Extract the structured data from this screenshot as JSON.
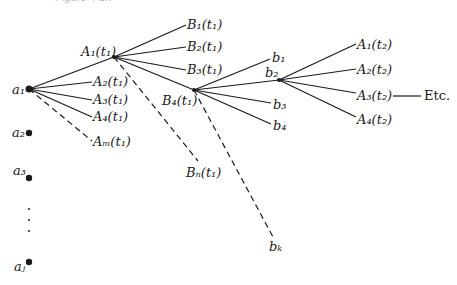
{
  "title": "Figure 4-2x",
  "nodes": {
    "a1": {
      "label": "a",
      "sub": "1",
      "x": 29,
      "y": 89
    },
    "a2": {
      "label": "a",
      "sub": "2",
      "x": 29,
      "y": 133
    },
    "a3": {
      "label": "a",
      "sub": "3",
      "x": 29,
      "y": 178
    },
    "aj": {
      "label": "a",
      "sub": "j",
      "x": 29,
      "y": 262
    },
    "A1t1": {
      "label": "A",
      "sub": "1",
      "arg": "(t",
      "argsub": "1",
      "x": 114,
      "y": 57
    },
    "B4t1": {
      "label": "B",
      "sub": "4",
      "arg": "(t",
      "argsub": "1",
      "x": 194,
      "y": 90
    },
    "b2": {
      "label": "b",
      "sub": "2",
      "x": 279,
      "y": 80
    }
  },
  "labels": {
    "a1": "a₁",
    "a2": "a₂",
    "a3": "a₃",
    "aj": "aⱼ",
    "A1t1": "A₁(t₁)",
    "A2t1": "A₂(t₁)",
    "A3t1": "A₃(t₁)",
    "A4t1": "A₄(t₁)",
    "Amt1": "Aₘ(t₁)",
    "B1t1": "B₁(t₁)",
    "B2t1": "B₂(t₁)",
    "B3t1": "B₃(t₁)",
    "B4t1": "B₄(t₁)",
    "Bnt1": "Bₙ(t₁)",
    "b1": "b₁",
    "b2": "b₂",
    "b3": "b₃",
    "b4": "b₄",
    "bk": "bₖ",
    "A1t2": "A₁(t₂)",
    "A2t2": "A₂(t₂)",
    "A3t2": "A₃(t₂)",
    "A4t2": "A₄(t₂)",
    "etc": "Etc.",
    "ellipsis": "⋮"
  },
  "edges": [
    {
      "from": "a1",
      "to": "A1t1",
      "style": "solid"
    },
    {
      "from": "a1",
      "to": "A2t1",
      "style": "solid"
    },
    {
      "from": "a1",
      "to": "A3t1",
      "style": "solid"
    },
    {
      "from": "a1",
      "to": "A4t1",
      "style": "solid"
    },
    {
      "from": "a1",
      "to": "Amt1",
      "style": "dashed"
    },
    {
      "from": "A1t1",
      "to": "B1t1",
      "style": "solid"
    },
    {
      "from": "A1t1",
      "to": "B2t1",
      "style": "solid"
    },
    {
      "from": "A1t1",
      "to": "B3t1",
      "style": "solid"
    },
    {
      "from": "A1t1",
      "to": "B4t1",
      "style": "solid"
    },
    {
      "from": "A1t1",
      "to": "Bnt1",
      "style": "dashed"
    },
    {
      "from": "B4t1",
      "to": "b1",
      "style": "solid"
    },
    {
      "from": "B4t1",
      "to": "b2",
      "style": "solid"
    },
    {
      "from": "B4t1",
      "to": "b3",
      "style": "solid"
    },
    {
      "from": "B4t1",
      "to": "b4",
      "style": "solid"
    },
    {
      "from": "B4t1",
      "to": "bk",
      "style": "dashed"
    },
    {
      "from": "b2",
      "to": "A1t2",
      "style": "solid"
    },
    {
      "from": "b2",
      "to": "A2t2",
      "style": "solid"
    },
    {
      "from": "b2",
      "to": "A3t2",
      "style": "solid"
    },
    {
      "from": "b2",
      "to": "A4t2",
      "style": "solid"
    },
    {
      "from": "A3t2",
      "to": "etc",
      "style": "solid"
    }
  ]
}
